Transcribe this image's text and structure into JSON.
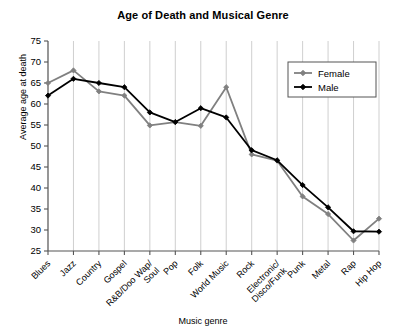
{
  "chart_data": {
    "type": "line",
    "title": "Age of Death and Musical Genre",
    "xlabel": "Music genre",
    "ylabel": "Average age at death",
    "ylim": [
      25,
      75
    ],
    "yticks": [
      25,
      30,
      35,
      40,
      45,
      50,
      55,
      60,
      65,
      70,
      75
    ],
    "grid": "vertical",
    "legend_position": "top-right",
    "categories": [
      "Blues",
      "Jazz",
      "Country",
      "Gospel",
      "R&B/Doo Wap/\nSoul",
      "Pop",
      "Folk",
      "World Music",
      "Rock",
      "Electronic/\nDisco/Funk",
      "Punk",
      "Metal",
      "Rap",
      "Hip Hop"
    ],
    "category_labels": [
      {
        "line1": "Blues",
        "line2": ""
      },
      {
        "line1": "Jazz",
        "line2": ""
      },
      {
        "line1": "Country",
        "line2": ""
      },
      {
        "line1": "Gospel",
        "line2": ""
      },
      {
        "line1": "R&B/Doo Wap/",
        "line2": "Soul"
      },
      {
        "line1": "Pop",
        "line2": ""
      },
      {
        "line1": "Folk",
        "line2": ""
      },
      {
        "line1": "World Music",
        "line2": ""
      },
      {
        "line1": "Rock",
        "line2": ""
      },
      {
        "line1": "Electronic/",
        "line2": "Disco/Funk"
      },
      {
        "line1": "Punk",
        "line2": ""
      },
      {
        "line1": "Metal",
        "line2": ""
      },
      {
        "line1": "Rap",
        "line2": ""
      },
      {
        "line1": "Hip Hop",
        "line2": ""
      }
    ],
    "series": [
      {
        "name": "Female",
        "color": "#808080",
        "values": [
          65.0,
          68.0,
          63.0,
          62.0,
          54.9,
          55.7,
          54.8,
          64.0,
          48.0,
          46.5,
          38.0,
          33.8,
          27.5,
          32.7
        ]
      },
      {
        "name": "Male",
        "color": "#000000",
        "values": [
          62.0,
          66.0,
          65.0,
          64.0,
          58.0,
          55.7,
          59.0,
          56.8,
          49.0,
          46.6,
          40.7,
          35.4,
          29.7,
          29.6
        ]
      }
    ]
  },
  "legend": {
    "entries": [
      {
        "label": "Female",
        "color": "#808080"
      },
      {
        "label": "Male",
        "color": "#000000"
      }
    ]
  },
  "axis": {
    "y_tick_labels": [
      "75",
      "70",
      "65",
      "60",
      "55",
      "50",
      "45",
      "40",
      "35",
      "30",
      "25"
    ]
  }
}
